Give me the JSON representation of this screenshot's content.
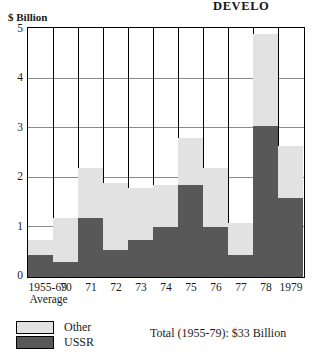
{
  "page": {
    "title": "DEVELO"
  },
  "legend": {
    "other_label": "Other",
    "ussr_label": "USSR",
    "total_note": "Total (1955-79): $33 Billion"
  },
  "colors": {
    "ussr": "#585858",
    "other": "#e2e2e2",
    "frame": "#000000",
    "grid": "#8b8b8b"
  },
  "chart_data": {
    "type": "bar",
    "stacked": true,
    "title": "DEVELO",
    "xlabel": "",
    "ylabel": "$ Billion",
    "ylim": [
      0,
      5
    ],
    "yticks": [
      0,
      1,
      2,
      3,
      4,
      5
    ],
    "ytick_labels": [
      "0",
      "1",
      "2",
      "3",
      "4",
      "5"
    ],
    "grid": "horizontal-and-vertical",
    "legend_position": "below-left",
    "categories": [
      "1955-69 Average",
      "70",
      "71",
      "72",
      "73",
      "74",
      "75",
      "76",
      "77",
      "78",
      "1979"
    ],
    "category_labels": [
      {
        "line1": "1955-69",
        "line2": "Average"
      },
      {
        "line1": "70",
        "line2": ""
      },
      {
        "line1": "71",
        "line2": ""
      },
      {
        "line1": "72",
        "line2": ""
      },
      {
        "line1": "73",
        "line2": ""
      },
      {
        "line1": "74",
        "line2": ""
      },
      {
        "line1": "75",
        "line2": ""
      },
      {
        "line1": "76",
        "line2": ""
      },
      {
        "line1": "77",
        "line2": ""
      },
      {
        "line1": "78",
        "line2": ""
      },
      {
        "line1": "1979",
        "line2": ""
      }
    ],
    "series": [
      {
        "name": "USSR",
        "color": "#585858",
        "values": [
          0.45,
          0.3,
          1.2,
          0.55,
          0.75,
          1.0,
          1.85,
          1.0,
          0.45,
          3.05,
          1.6
        ]
      },
      {
        "name": "Other",
        "color": "#e2e2e2",
        "values": [
          0.3,
          0.9,
          1.0,
          1.35,
          1.05,
          0.85,
          0.95,
          1.2,
          0.65,
          1.85,
          1.05
        ]
      }
    ],
    "totals": [
      0.75,
      1.2,
      2.2,
      1.9,
      1.8,
      1.85,
      2.8,
      2.2,
      1.1,
      4.9,
      2.65
    ],
    "annotation": "Total (1955-79): $33 Billion"
  }
}
